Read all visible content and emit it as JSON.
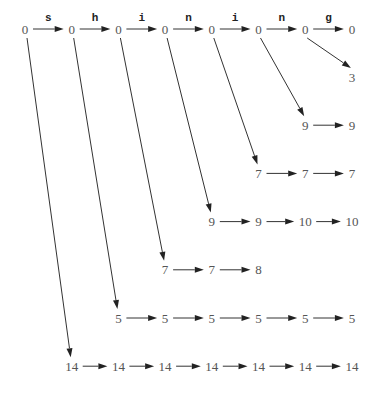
{
  "diagram": {
    "title": "",
    "word": "shining",
    "top_row": {
      "values": [
        "0",
        "0",
        "0",
        "0",
        "0",
        "0",
        "0",
        "0"
      ],
      "edge_labels": [
        "s",
        "h",
        "i",
        "n",
        "i",
        "n",
        "g"
      ]
    },
    "rows": [
      {
        "from_top_column": 6,
        "start_column": 7,
        "values": [
          "3"
        ]
      },
      {
        "from_top_column": 5,
        "start_column": 6,
        "values": [
          "9",
          "9"
        ]
      },
      {
        "from_top_column": 4,
        "start_column": 5,
        "values": [
          "7",
          "7",
          "7"
        ]
      },
      {
        "from_top_column": 3,
        "start_column": 4,
        "values": [
          "9",
          "9",
          "10",
          "10"
        ]
      },
      {
        "from_top_column": 2,
        "start_column": 3,
        "values": [
          "7",
          "7",
          "8"
        ]
      },
      {
        "from_top_column": 1,
        "start_column": 2,
        "values": [
          "5",
          "5",
          "5",
          "5",
          "5",
          "5"
        ]
      },
      {
        "from_top_column": 0,
        "start_column": 1,
        "values": [
          "14",
          "14",
          "14",
          "14",
          "14",
          "14",
          "14"
        ]
      }
    ]
  }
}
